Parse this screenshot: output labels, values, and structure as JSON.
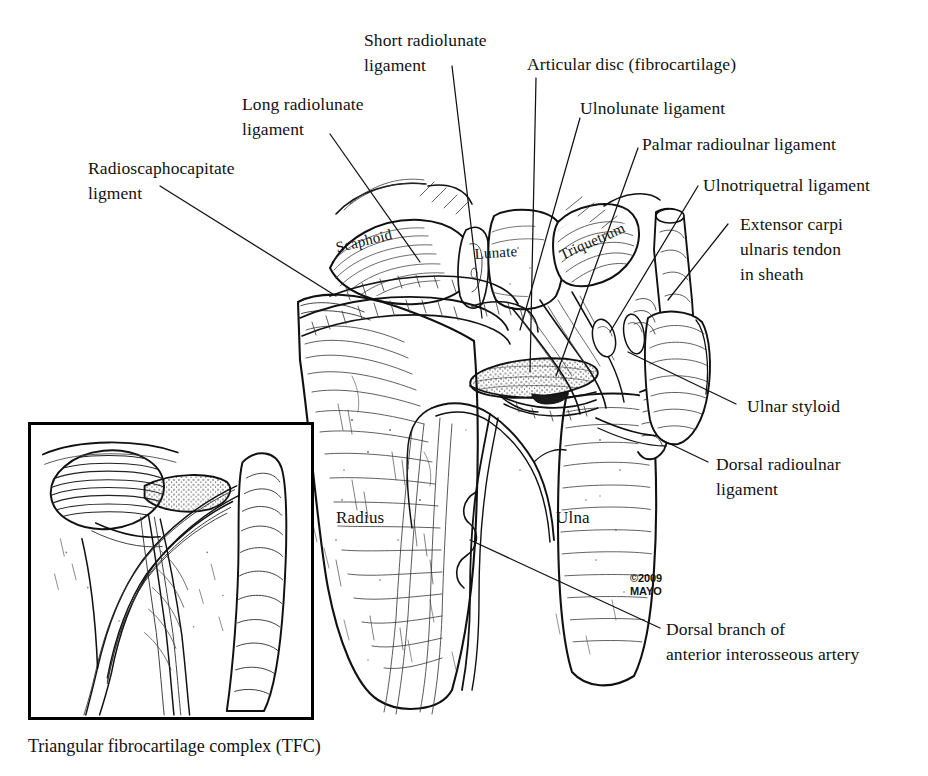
{
  "figure": {
    "title": "Triangular fibrocartilage complex (TFC)",
    "caption": "Triangular fibrocartilage complex (TFC)",
    "copyright": "©2009\nMAYO",
    "background_color": "#ffffff",
    "ink_color": "#111111",
    "style": "pen-and-ink medical illustration"
  },
  "labels": {
    "short_radiolunate": "Short radiolunate\nligament",
    "long_radiolunate": "Long radiolunate\nligament",
    "radioscaphocapitate": "Radioscaphocapitate\nligment",
    "articular_disc": "Articular disc (fibrocartilage)",
    "ulnolunate": "Ulnolunate ligament",
    "palmar_radioulnar": "Palmar radioulnar ligament",
    "ulnotriquetral": "Ulnotriquetral ligament",
    "extensor_carpi_ulnaris": "Extensor carpi\nulnaris tendon\nin sheath",
    "ulnar_styloid": "Ulnar styloid",
    "dorsal_radioulnar": "Dorsal radioulnar\nligament",
    "dorsal_branch_artery": "Dorsal branch of\nanterior interosseous artery"
  },
  "bone_labels": {
    "scaphoid": "Scaphoid",
    "lunate": "Lunate",
    "triquetrum": "Triquetrum",
    "radius": "Radius",
    "ulna": "Ulna"
  },
  "inset": {
    "name": "coronal-section-inset",
    "description": "Coronal section of the triangular fibrocartilage complex"
  }
}
